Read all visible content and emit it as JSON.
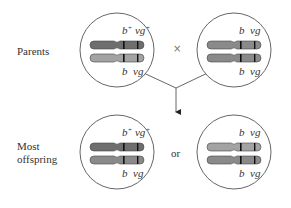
{
  "labels": {
    "parents": "Parents",
    "offspring_line1": "Most",
    "offspring_line2": "offspring",
    "cross_symbol": "×",
    "or": "or"
  },
  "cells": [
    {
      "id": "parent-dihybrid",
      "top_label": {
        "b": "b",
        "b_sup": "+",
        "vg": "vg",
        "vg_sup": "+"
      },
      "bottom_label": {
        "b": "b",
        "vg": "vg"
      },
      "chromosome_colors": [
        "#6e6e6e",
        "#a3a3a3"
      ]
    },
    {
      "id": "parent-homozygous",
      "top_label": {
        "b": "b",
        "vg": "vg"
      },
      "bottom_label": {
        "b": "b",
        "vg": "vg"
      },
      "chromosome_colors": [
        "#8a8a8a",
        "#8a8a8a"
      ]
    },
    {
      "id": "offspring-dihybrid",
      "top_label": {
        "b": "b",
        "b_sup": "+",
        "vg": "vg",
        "vg_sup": "+"
      },
      "bottom_label": {
        "b": "b",
        "vg": "vg"
      },
      "chromosome_colors": [
        "#6e6e6e",
        "#8a8a8a"
      ]
    },
    {
      "id": "offspring-homozygous",
      "top_label": {
        "b": "b",
        "vg": "vg"
      },
      "bottom_label": {
        "b": "b",
        "vg": "vg"
      },
      "chromosome_colors": [
        "#a3a3a3",
        "#8a8a8a"
      ]
    }
  ],
  "colors": {
    "outline": "#555555",
    "band": "#111111",
    "text": "#333333"
  }
}
